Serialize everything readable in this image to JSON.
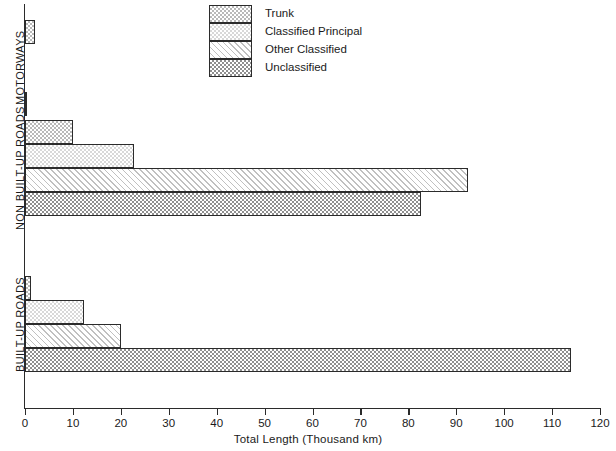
{
  "chart_data": {
    "type": "bar",
    "orientation": "horizontal",
    "title": "",
    "xlabel": "Total Length (Thousand km)",
    "ylabel": "",
    "xlim": [
      0,
      120
    ],
    "xticks": [
      0,
      10,
      20,
      30,
      40,
      50,
      60,
      70,
      80,
      90,
      100,
      110,
      120
    ],
    "grid": false,
    "legend_position": "top-center",
    "categories": [
      "MOTORWAYS",
      "NON BUILT-UP ROADS",
      "BUILT-UP ROADS"
    ],
    "series": [
      {
        "name": "Trunk",
        "values": [
          2.1,
          10.0,
          1.3
        ]
      },
      {
        "name": "Classified Principal",
        "values": [
          0,
          22.7,
          12.3
        ]
      },
      {
        "name": "Other Classified",
        "values": [
          0,
          92.5,
          20.0
        ]
      },
      {
        "name": "Unclassified",
        "values": [
          0.4,
          82.7,
          114.0
        ]
      }
    ]
  },
  "legend": {
    "items": [
      {
        "label": "Trunk",
        "pattern": "fine-dot"
      },
      {
        "label": "Classified Principal",
        "pattern": "light-dot"
      },
      {
        "label": "Other Classified",
        "pattern": "diagonal-hatch"
      },
      {
        "label": "Unclassified",
        "pattern": "dense-dot"
      }
    ]
  },
  "axis": {
    "x_title": "Total Length (Thousand km)",
    "tick_labels": [
      "0",
      "10",
      "20",
      "30",
      "40",
      "50",
      "60",
      "70",
      "80",
      "90",
      "100",
      "110",
      "120"
    ]
  },
  "groups": [
    {
      "label": "MOTORWAYS"
    },
    {
      "label": "NON BUILT-UP ROADS"
    },
    {
      "label": "BUILT-UP ROADS"
    }
  ]
}
